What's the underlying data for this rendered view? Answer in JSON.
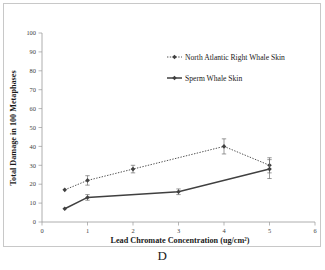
{
  "panel": {
    "label": "D"
  },
  "chart_data": {
    "type": "line",
    "title": "",
    "xlabel": "Lead Chromate Concentration (ug/cm²)",
    "ylabel": "Total Damage in 100 Metaphases",
    "xlim": [
      0,
      6
    ],
    "ylim": [
      0,
      100
    ],
    "xticks": [
      0,
      1,
      2,
      3,
      4,
      5,
      6
    ],
    "xtick_labels": [
      "0",
      "1",
      "2",
      "3",
      "4",
      "5",
      "6"
    ],
    "yticks": [
      0,
      10,
      20,
      30,
      40,
      50,
      60,
      70,
      80,
      90,
      100
    ],
    "ytick_labels": [
      "0",
      "10",
      "20",
      "30",
      "40",
      "50",
      "60",
      "70",
      "80",
      "90",
      "100"
    ],
    "grid": false,
    "legend_position": "upper center",
    "series": [
      {
        "name": "North Atlantic Right Whale Skin",
        "line_style": "dotted",
        "marker": "diamond",
        "color": "#404040",
        "x": [
          0.5,
          1,
          2,
          4,
          5
        ],
        "values": [
          17,
          22,
          28,
          40,
          30
        ],
        "errors": [
          0,
          2.5,
          2,
          4,
          4
        ]
      },
      {
        "name": "Sperm Whale Skin",
        "line_style": "solid",
        "marker": "diamond",
        "color": "#404040",
        "x": [
          0.5,
          1,
          3,
          5
        ],
        "values": [
          7,
          13,
          16,
          28
        ],
        "errors": [
          0,
          1.5,
          1.5,
          5
        ]
      }
    ]
  },
  "legend": {
    "items": [
      {
        "label": "North Atlantic Right Whale Skin",
        "style": "dotted"
      },
      {
        "label": "Sperm Whale Skin",
        "style": "solid"
      }
    ]
  },
  "colors": {
    "axis": "#808080",
    "series": "#404040",
    "text": "#1a1a1a",
    "frame": "#c8c8c8"
  }
}
